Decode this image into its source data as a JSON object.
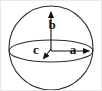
{
  "figure": {
    "type": "geometry-diagram",
    "background_color": "#ffffff",
    "stroke_color": "#2b2b2b",
    "label_color": "#111111",
    "border_color": "#e8e8e8",
    "width": 102,
    "height": 91
  },
  "shapes": {
    "sphere": {
      "name": "sphere-outline",
      "center_x": 50,
      "center_y": 47,
      "radius": 42
    },
    "equator": {
      "name": "equator-ellipse",
      "center_x": 50,
      "center_y": 50,
      "radius_x": 42,
      "radius_y": 11
    }
  },
  "axes": [
    {
      "id": "a",
      "label": "a",
      "direction": "right",
      "label_x": 72,
      "label_y": 50,
      "from_x": 50,
      "from_y": 50,
      "to_x": 92,
      "to_y": 50
    },
    {
      "id": "b",
      "label": "b",
      "direction": "up",
      "label_x": 51,
      "label_y": 25,
      "from_x": 50,
      "from_y": 50,
      "to_x": 50,
      "to_y": 7
    },
    {
      "id": "c",
      "label": "c",
      "direction": "down-left-toward-viewer",
      "label_x": 35,
      "label_y": 50,
      "from_x": 50,
      "from_y": 48,
      "to_x": 41,
      "to_y": 59
    }
  ]
}
